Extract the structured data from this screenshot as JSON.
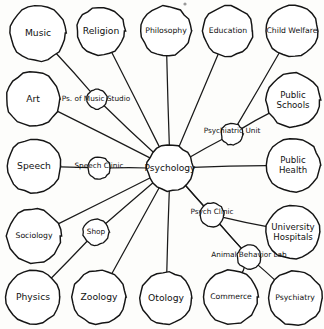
{
  "diagram": {
    "type": "hand-drawn-node-link-diagram",
    "center": {
      "id": "psychology",
      "label": "Psychology",
      "cx": 170,
      "cy": 168,
      "r": 23
    },
    "colors": {
      "ink": "#151515",
      "paper": "#fdfdfb",
      "line": "#1a1a1a"
    },
    "discipline_nodes": [
      {
        "id": "music",
        "label": "Music",
        "cx": 38,
        "cy": 33,
        "r": 28,
        "style": "discipline"
      },
      {
        "id": "religion",
        "label": "Religion",
        "cx": 101,
        "cy": 31,
        "r": 24,
        "style": "discipline"
      },
      {
        "id": "philosophy",
        "label": "Philosophy",
        "cx": 166,
        "cy": 31,
        "r": 25,
        "style": "discipline tight"
      },
      {
        "id": "education",
        "label": "Education",
        "cx": 228,
        "cy": 31,
        "r": 25,
        "style": "discipline tight"
      },
      {
        "id": "child-welfare",
        "label": "Child Welfare",
        "cx": 292,
        "cy": 31,
        "r": 26,
        "style": "discipline tight"
      },
      {
        "id": "art",
        "label": "Art",
        "cx": 33,
        "cy": 99,
        "r": 27,
        "style": "discipline"
      },
      {
        "id": "public-schools",
        "label": "Public Schools",
        "cx": 293,
        "cy": 100,
        "r": 27,
        "style": "discipline two-line"
      },
      {
        "id": "speech",
        "label": "Speech",
        "cx": 34,
        "cy": 166,
        "r": 27,
        "style": "discipline"
      },
      {
        "id": "public-health",
        "label": "Public Health",
        "cx": 293,
        "cy": 165,
        "r": 27,
        "style": "discipline two-line"
      },
      {
        "id": "sociology",
        "label": "Sociology",
        "cx": 34,
        "cy": 236,
        "r": 27,
        "style": "discipline tight"
      },
      {
        "id": "university-hospitals",
        "label": "University Hospitals",
        "cx": 293,
        "cy": 232,
        "r": 27,
        "style": "discipline two-line"
      },
      {
        "id": "physics",
        "label": "Physics",
        "cx": 33,
        "cy": 297,
        "r": 27,
        "style": "discipline"
      },
      {
        "id": "zoology",
        "label": "Zoology",
        "cx": 99,
        "cy": 297,
        "r": 27,
        "style": "discipline"
      },
      {
        "id": "otology",
        "label": "Otology",
        "cx": 166,
        "cy": 298,
        "r": 26,
        "style": "discipline"
      },
      {
        "id": "commerce",
        "label": "Commerce",
        "cx": 231,
        "cy": 297,
        "r": 27,
        "style": "discipline tight"
      },
      {
        "id": "psychiatry",
        "label": "Psychiatry",
        "cx": 295,
        "cy": 298,
        "r": 27,
        "style": "discipline tight"
      }
    ],
    "facility_nodes": [
      {
        "id": "music-studio",
        "label": "Ps. of Music Studio",
        "cx": 97,
        "cy": 99,
        "r": 10,
        "label_cx": 96,
        "label_cy": 99
      },
      {
        "id": "psychiatric-unit",
        "label": "Psychiatric Unit",
        "cx": 232,
        "cy": 134,
        "r": 11,
        "label_cx": 232,
        "label_cy": 131
      },
      {
        "id": "speech-clinic",
        "label": "Speech Clinic",
        "cx": 99,
        "cy": 168,
        "r": 11,
        "label_cx": 99,
        "label_cy": 166
      },
      {
        "id": "psych-clinic",
        "label": "Psych Clinic",
        "cx": 212,
        "cy": 215,
        "r": 12,
        "label_cx": 212,
        "label_cy": 212
      },
      {
        "id": "shop",
        "label": "Shop",
        "cx": 96,
        "cy": 232,
        "r": 13,
        "label_cx": 96,
        "label_cy": 232
      },
      {
        "id": "animal-behavior-lab",
        "label": "Animal Behavior Lab",
        "cx": 249,
        "cy": 257,
        "r": 12,
        "label_cx": 249,
        "label_cy": 255
      }
    ],
    "edges": [
      {
        "id": "edge-music-studio",
        "from": "music",
        "to": "music-studio"
      },
      {
        "id": "edge-studio-center",
        "from": "music-studio",
        "to": "psychology"
      },
      {
        "id": "edge-religion-center",
        "from": "religion",
        "to": "psychology"
      },
      {
        "id": "edge-philosophy-center",
        "from": "philosophy",
        "to": "psychology"
      },
      {
        "id": "edge-education-center",
        "from": "education",
        "to": "psychology"
      },
      {
        "id": "edge-childwelfare-unit",
        "from": "child-welfare",
        "to": "psychiatric-unit"
      },
      {
        "id": "edge-unit-center",
        "from": "psychiatric-unit",
        "to": "psychology"
      },
      {
        "id": "edge-schools-unit",
        "from": "public-schools",
        "to": "psychiatric-unit"
      },
      {
        "id": "edge-art-center",
        "from": "art",
        "to": "psychology"
      },
      {
        "id": "edge-speech-clinic",
        "from": "speech",
        "to": "speech-clinic"
      },
      {
        "id": "edge-clinic-center",
        "from": "speech-clinic",
        "to": "psychology"
      },
      {
        "id": "edge-publichealth-center",
        "from": "public-health",
        "to": "psychology"
      },
      {
        "id": "edge-sociology-center",
        "from": "sociology",
        "to": "psychology"
      },
      {
        "id": "edge-hospitals-psychclinic",
        "from": "university-hospitals",
        "to": "psych-clinic"
      },
      {
        "id": "edge-psychclinic-center",
        "from": "psych-clinic",
        "to": "psychology"
      },
      {
        "id": "edge-physics-shop",
        "from": "physics",
        "to": "shop"
      },
      {
        "id": "edge-shop-center",
        "from": "shop",
        "to": "psychology"
      },
      {
        "id": "edge-zoology-center",
        "from": "zoology",
        "to": "psychology"
      },
      {
        "id": "edge-otology-center",
        "from": "otology",
        "to": "psychology"
      },
      {
        "id": "edge-commerce-lab",
        "from": "commerce",
        "to": "animal-behavior-lab"
      },
      {
        "id": "edge-lab-center",
        "from": "animal-behavior-lab",
        "to": "psychology"
      },
      {
        "id": "edge-psychiatry-lab",
        "from": "psychiatry",
        "to": "animal-behavior-lab"
      },
      {
        "id": "edge-psychclinic-lab",
        "from": "psych-clinic",
        "to": "animal-behavior-lab"
      }
    ]
  }
}
